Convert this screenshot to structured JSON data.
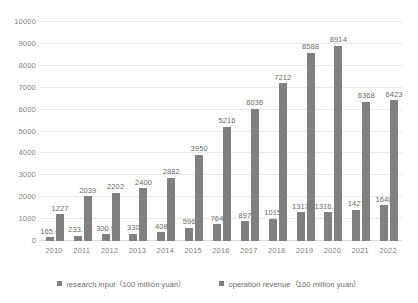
{
  "chart_data": {
    "type": "bar",
    "title": "",
    "xlabel": "",
    "ylabel": "",
    "ylim": [
      0,
      10000
    ],
    "ytick_step": 1000,
    "grid": true,
    "legend_position": "bottom",
    "bar_color": "#808080",
    "gridline_color": "#e8e8e8",
    "text_color": "#7f7f7f",
    "categories": [
      "2010",
      "2011",
      "2012",
      "2013",
      "2014",
      "2015",
      "2016",
      "2017",
      "2018",
      "2019",
      "2020",
      "2021",
      "2022"
    ],
    "yticks": [
      "10000",
      "9000",
      "8000",
      "7000",
      "6000",
      "5000",
      "4000",
      "3000",
      "2000",
      "1000",
      "0"
    ],
    "ytick_values": [
      10000,
      9000,
      8000,
      7000,
      6000,
      5000,
      4000,
      3000,
      2000,
      1000,
      0
    ],
    "series": [
      {
        "name": "research input（100 million yuan）",
        "values": [
          165.6,
          233.7,
          300.9,
          330,
          408,
          596,
          764,
          897,
          1015,
          1317,
          1316.59,
          1427,
          1640
        ],
        "labels": [
          "165.6",
          "233.7",
          "300.9",
          "330",
          "408",
          "596",
          "764",
          "897",
          "1015",
          "1317",
          "1316.59",
          "1427",
          "1640"
        ]
      },
      {
        "name": "operation revenue（100 million yuan）",
        "values": [
          1227,
          2039,
          2202,
          2400,
          2882,
          3950,
          5216,
          6036,
          7212,
          8588,
          8914,
          6368,
          6423
        ],
        "labels": [
          "1227",
          "2039",
          "2202",
          "2400",
          "2882",
          "3950",
          "5216",
          "6036",
          "7212",
          "8588",
          "8914",
          "6368",
          "6423"
        ]
      }
    ]
  },
  "legend": {
    "items": [
      {
        "label": "research input（100 million yuan）"
      },
      {
        "label": "operation revenue（100 million yuan）"
      }
    ]
  }
}
